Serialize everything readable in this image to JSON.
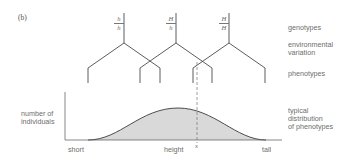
{
  "figure": {
    "panel_label": "(b)",
    "genotypes": [
      {
        "top": "h",
        "bottom": "h",
        "x": 124
      },
      {
        "top": "H",
        "bottom": "h",
        "x": 176
      },
      {
        "top": "H",
        "bottom": "H",
        "x": 229
      }
    ],
    "row_labels": {
      "genotypes": "genotypes",
      "environmental_variation": "environmental\nvariation",
      "phenotypes": "phenotypes",
      "distribution": "typical\ndistribution\nof phenotypes"
    },
    "axis": {
      "y_label": "number of\nindividuals",
      "x_label_left": "short",
      "x_label_center": "height",
      "x_label_right": "tall",
      "marker_label": "x"
    },
    "colors": {
      "line": "#444444",
      "fill": "#d6d6d6",
      "dashed": "#777777",
      "text": "#6e6e6e"
    }
  }
}
